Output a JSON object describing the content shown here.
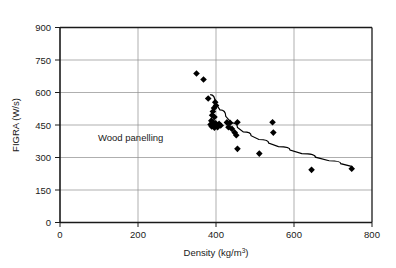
{
  "chart_data": {
    "type": "scatter",
    "title": "",
    "xlabel": "Density (kg/m3)",
    "xlabel_base": "Density (kg/m",
    "xlabel_sup": "3",
    "xlabel_close": ")",
    "ylabel": "FIGRA (W/s)",
    "xlim": [
      0,
      800
    ],
    "ylim": [
      0,
      900
    ],
    "xticks": [
      0,
      200,
      400,
      600,
      800
    ],
    "yticks": [
      0,
      150,
      300,
      450,
      600,
      750,
      900
    ],
    "xtick_labels": [
      "0",
      "200",
      "400",
      "600",
      "800"
    ],
    "ytick_labels": [
      "0",
      "150",
      "300",
      "450",
      "600",
      "750",
      "900"
    ],
    "grid": "both",
    "legend": "none",
    "marker": "filled-diamond",
    "marker_color": "#000000",
    "annotations": [
      {
        "text": "Wood panelling",
        "x": 175,
        "y": 395
      }
    ],
    "points": [
      {
        "x": 350,
        "y": 688
      },
      {
        "x": 368,
        "y": 660
      },
      {
        "x": 380,
        "y": 572
      },
      {
        "x": 398,
        "y": 555
      },
      {
        "x": 400,
        "y": 540
      },
      {
        "x": 395,
        "y": 528
      },
      {
        "x": 392,
        "y": 512
      },
      {
        "x": 390,
        "y": 495
      },
      {
        "x": 396,
        "y": 487
      },
      {
        "x": 388,
        "y": 470
      },
      {
        "x": 393,
        "y": 462
      },
      {
        "x": 399,
        "y": 458
      },
      {
        "x": 386,
        "y": 452
      },
      {
        "x": 391,
        "y": 448
      },
      {
        "x": 397,
        "y": 445
      },
      {
        "x": 403,
        "y": 450
      },
      {
        "x": 408,
        "y": 455
      },
      {
        "x": 412,
        "y": 448
      },
      {
        "x": 404,
        "y": 440
      },
      {
        "x": 396,
        "y": 437
      },
      {
        "x": 389,
        "y": 443
      },
      {
        "x": 428,
        "y": 462
      },
      {
        "x": 436,
        "y": 460
      },
      {
        "x": 455,
        "y": 463
      },
      {
        "x": 432,
        "y": 440
      },
      {
        "x": 441,
        "y": 432
      },
      {
        "x": 448,
        "y": 415
      },
      {
        "x": 452,
        "y": 403
      },
      {
        "x": 455,
        "y": 340
      },
      {
        "x": 511,
        "y": 318
      },
      {
        "x": 545,
        "y": 463
      },
      {
        "x": 547,
        "y": 415
      },
      {
        "x": 645,
        "y": 243
      },
      {
        "x": 748,
        "y": 248
      }
    ],
    "trend_curve": {
      "description": "decreasing power-law fit line",
      "points": [
        {
          "x": 385,
          "y": 590
        },
        {
          "x": 410,
          "y": 520
        },
        {
          "x": 440,
          "y": 460
        },
        {
          "x": 470,
          "y": 418
        },
        {
          "x": 510,
          "y": 383
        },
        {
          "x": 560,
          "y": 350
        },
        {
          "x": 620,
          "y": 318
        },
        {
          "x": 690,
          "y": 285
        },
        {
          "x": 750,
          "y": 258
        }
      ]
    }
  },
  "colors": {
    "axis": "#1a1a1a",
    "grid": "#808080",
    "marker": "#000000",
    "trend": "#000000",
    "background": "#ffffff"
  }
}
